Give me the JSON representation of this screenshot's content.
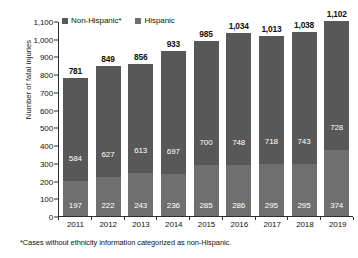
{
  "chart_data": {
    "type": "bar",
    "subtype": "stacked-vertical",
    "title": "",
    "xlabel": "",
    "ylabel": "Number of fatal injuries",
    "ylim": [
      0,
      1100
    ],
    "ytick_step": 100,
    "ytick_labels": [
      "1,100",
      "1,000",
      "900",
      "800",
      "700",
      "600",
      "500",
      "400",
      "300",
      "200",
      "100",
      "0"
    ],
    "ytick_values": [
      1100,
      1000,
      900,
      800,
      700,
      600,
      500,
      400,
      300,
      200,
      100,
      0
    ],
    "grid": false,
    "legend_position": "top-left",
    "categories": [
      "2011",
      "2012",
      "2013",
      "2014",
      "2015",
      "2016",
      "2017",
      "2018",
      "2019"
    ],
    "series": [
      {
        "name": "Hispanic",
        "color": "#6f6f6f",
        "values": [
          197,
          222,
          243,
          236,
          285,
          286,
          295,
          295,
          374
        ]
      },
      {
        "name": "Non-Hispanic*",
        "color": "#585858",
        "values": [
          584,
          627,
          613,
          697,
          700,
          748,
          718,
          743,
          728
        ]
      }
    ],
    "totals": [
      781,
      849,
      856,
      933,
      985,
      1034,
      1013,
      1038,
      1102
    ],
    "total_labels": [
      "781",
      "849",
      "856",
      "933",
      "985",
      "1,034",
      "1,013",
      "1,038",
      "1,102"
    ],
    "annotations": [
      "*Cases without ethnicity information categorized as non-Hispanic."
    ]
  },
  "legend": {
    "items": [
      {
        "label": "Non-Hispanic*",
        "color": "#585858"
      },
      {
        "label": "Hispanic",
        "color": "#6f6f6f"
      }
    ]
  },
  "axis": {
    "y_title": "Number of fatal injuries"
  },
  "footnote": {
    "text": "*Cases without ethnicity information categorized as non-Hispanic."
  },
  "colors": {
    "non_hispanic": "#585858",
    "hispanic": "#6f6f6f",
    "axis": "#2b2b2b",
    "text": "#111111",
    "background": "#ffffff"
  }
}
